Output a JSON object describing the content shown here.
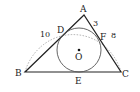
{
  "diagram": {
    "type": "geometry",
    "points": {
      "A": {
        "label": "A",
        "x": 84,
        "y": 15
      },
      "B": {
        "label": "B",
        "x": 25,
        "y": 72
      },
      "C": {
        "label": "C",
        "x": 121,
        "y": 72
      },
      "D": {
        "label": "D",
        "x": 62,
        "y": 30
      },
      "E": {
        "label": "E",
        "x": 78,
        "y": 72
      },
      "F": {
        "label": "F",
        "x": 101,
        "y": 37
      },
      "O": {
        "label": "O",
        "x": 79,
        "y": 51
      }
    },
    "lengths": {
      "AB": "10",
      "AC": "8",
      "AF": "3"
    },
    "colors": {
      "stroke": "#222222",
      "circle": "#555555",
      "arc": "#999999"
    }
  }
}
